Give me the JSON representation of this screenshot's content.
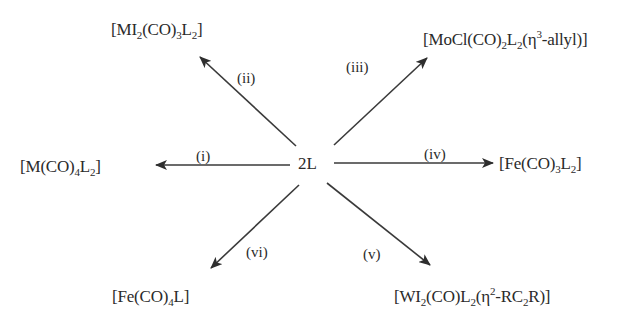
{
  "diagram": {
    "type": "reaction-scheme",
    "center": {
      "label": "2L"
    },
    "line_color": "#3a3a3a",
    "text_color": "#2a2a2a",
    "reactions": [
      {
        "id": "i",
        "condition": "(i)",
        "direction": "left",
        "product": {
          "parts": [
            "[M(CO)",
            "4",
            "L",
            "2",
            "]"
          ],
          "text": "[M(CO)4L2]"
        }
      },
      {
        "id": "ii",
        "condition": "(ii)",
        "direction": "up-left",
        "product": {
          "parts": [
            "[MI",
            "2",
            "(CO)",
            "3",
            "L",
            "2",
            "]"
          ],
          "text": "[MI2(CO)3L2]"
        }
      },
      {
        "id": "iii",
        "condition": "(iii)",
        "direction": "up-right",
        "product": {
          "parts": [
            "[MoCl(CO)",
            "2",
            "L",
            "2",
            "(η",
            "3",
            "-allyl)]"
          ],
          "text": "[MoCl(CO)2L2(η3-allyl)]"
        }
      },
      {
        "id": "iv",
        "condition": "(iv)",
        "direction": "right",
        "product": {
          "parts": [
            "[Fe(CO)",
            "3",
            "L",
            "2",
            "]"
          ],
          "text": "[Fe(CO)3L2]"
        }
      },
      {
        "id": "v",
        "condition": "(v)",
        "direction": "down-right",
        "product": {
          "parts": [
            "[WI",
            "2",
            "(CO)L",
            "2",
            "(η",
            "2",
            "-RC",
            "2",
            "R)]"
          ],
          "text": "[WI2(CO)L2(η2-RC2R)]"
        }
      },
      {
        "id": "vi",
        "condition": "(vi)",
        "direction": "down-left",
        "product": {
          "parts": [
            "[Fe(CO)",
            "4",
            "L]"
          ],
          "text": "[Fe(CO)4L]"
        }
      }
    ]
  }
}
